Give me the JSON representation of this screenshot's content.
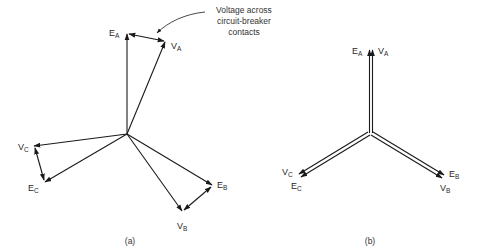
{
  "figure": {
    "colors": {
      "stroke": "#1a1a1a",
      "text": "#2a2a2a",
      "background": "#ffffff"
    },
    "annotation": {
      "lines": [
        "Voltage across",
        "circuit-breaker",
        "contacts"
      ]
    },
    "panel_a": {
      "caption": "(a)",
      "labels": {
        "EA": {
          "main": "E",
          "sub": "A"
        },
        "VA": {
          "main": "V",
          "sub": "A"
        },
        "EB": {
          "main": "E",
          "sub": "B"
        },
        "VB": {
          "main": "V",
          "sub": "B"
        },
        "EC": {
          "main": "E",
          "sub": "C"
        },
        "VC": {
          "main": "V",
          "sub": "C"
        }
      }
    },
    "panel_b": {
      "caption": "(b)",
      "labels": {
        "EA": {
          "main": "E",
          "sub": "A"
        },
        "VA": {
          "main": "V",
          "sub": "A"
        },
        "EB": {
          "main": "E",
          "sub": "B"
        },
        "VB": {
          "main": "V",
          "sub": "B"
        },
        "EC": {
          "main": "E",
          "sub": "C"
        },
        "VC": {
          "main": "V",
          "sub": "C"
        }
      }
    }
  }
}
